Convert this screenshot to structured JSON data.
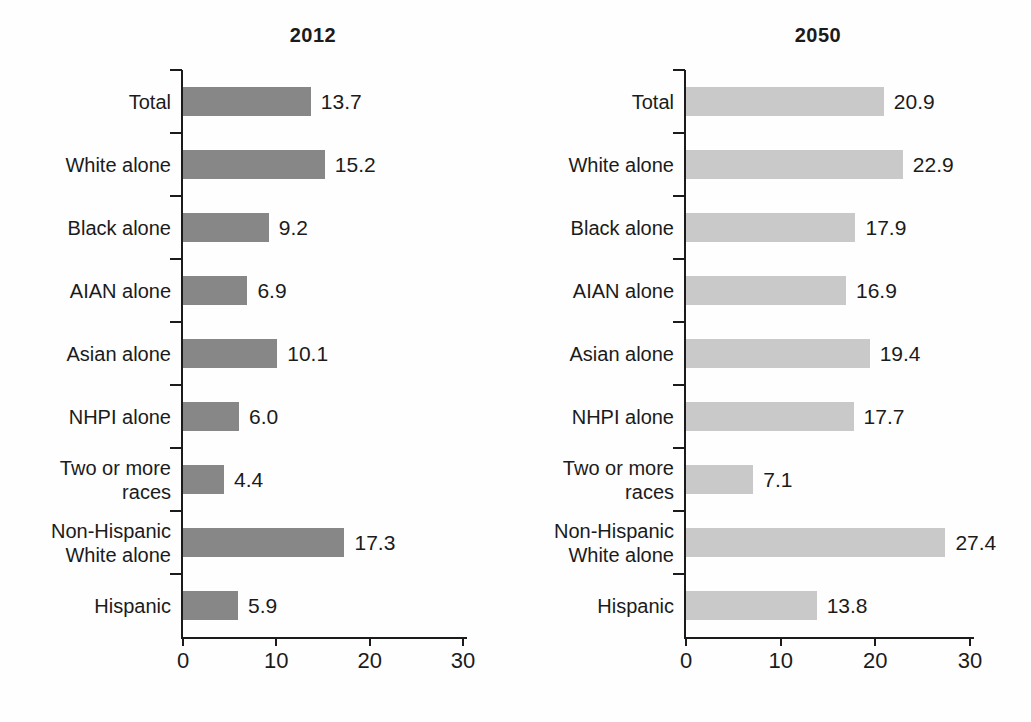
{
  "colors": {
    "bar_2012": "#878787",
    "bar_2050": "#c9c9c9",
    "axis": "#1b1b1b",
    "background": "#fefefe"
  },
  "chart_data": [
    {
      "type": "bar",
      "orientation": "horizontal",
      "title": "2012",
      "categories": [
        "Total",
        "White alone",
        "Black alone",
        "AIAN alone",
        "Asian alone",
        "NHPI alone",
        "Two or more races",
        "Non-Hispanic White alone",
        "Hispanic"
      ],
      "category_lines": [
        [
          "Total"
        ],
        [
          "White alone"
        ],
        [
          "Black alone"
        ],
        [
          "AIAN alone"
        ],
        [
          "Asian alone"
        ],
        [
          "NHPI alone"
        ],
        [
          "Two or more",
          "races"
        ],
        [
          "Non-Hispanic",
          "White alone"
        ],
        [
          "Hispanic"
        ]
      ],
      "values": [
        13.7,
        15.2,
        9.2,
        6.9,
        10.1,
        6.0,
        4.4,
        17.3,
        5.9
      ],
      "value_labels": [
        "13.7",
        "15.2",
        "9.2",
        "6.9",
        "10.1",
        "6.0",
        "4.4",
        "17.3",
        "5.9"
      ],
      "xlabel": "",
      "ylabel": "",
      "xlim": [
        0,
        30
      ],
      "xticks": [
        0,
        10,
        20,
        30
      ],
      "grid": false,
      "legend": false,
      "bar_color": "#878787"
    },
    {
      "type": "bar",
      "orientation": "horizontal",
      "title": "2050",
      "categories": [
        "Total",
        "White alone",
        "Black alone",
        "AIAN alone",
        "Asian alone",
        "NHPI alone",
        "Two or more races",
        "Non-Hispanic White alone",
        "Hispanic"
      ],
      "category_lines": [
        [
          "Total"
        ],
        [
          "White alone"
        ],
        [
          "Black alone"
        ],
        [
          "AIAN alone"
        ],
        [
          "Asian alone"
        ],
        [
          "NHPI alone"
        ],
        [
          "Two or more",
          "races"
        ],
        [
          "Non-Hispanic",
          "White alone"
        ],
        [
          "Hispanic"
        ]
      ],
      "values": [
        20.9,
        22.9,
        17.9,
        16.9,
        19.4,
        17.7,
        7.1,
        27.4,
        13.8
      ],
      "value_labels": [
        "20.9",
        "22.9",
        "17.9",
        "16.9",
        "19.4",
        "17.7",
        "7.1",
        "27.4",
        "13.8"
      ],
      "xlabel": "",
      "ylabel": "",
      "xlim": [
        0,
        30
      ],
      "xticks": [
        0,
        10,
        20,
        30
      ],
      "grid": false,
      "legend": false,
      "bar_color": "#c9c9c9"
    }
  ]
}
